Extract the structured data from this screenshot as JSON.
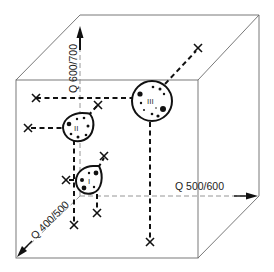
{
  "diagram": {
    "type": "3d-cube-cluster-diagram",
    "axes": [
      {
        "id": "vertical",
        "label": "Q 600/700",
        "direction": "up"
      },
      {
        "id": "horizontal",
        "label": "Q 500/600",
        "direction": "right"
      },
      {
        "id": "depth",
        "label": "Q 400/500",
        "direction": "toward-viewer"
      }
    ],
    "clusters": [
      {
        "id": "I",
        "label": "I"
      },
      {
        "id": "II",
        "label": "II"
      },
      {
        "id": "III",
        "label": "III"
      }
    ],
    "colors": {
      "ink": "#111111",
      "frame": "#6a6a6a",
      "axis": "#8a8a8a",
      "background": "#ffffff"
    }
  }
}
